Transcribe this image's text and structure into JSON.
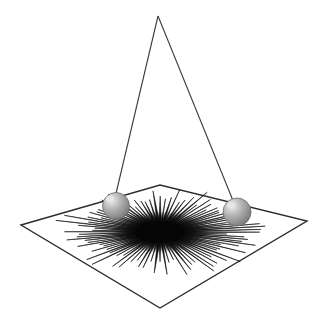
{
  "scene": {
    "title": "Spherical pendulum with radial spike burst on ground plane",
    "width": 329,
    "height": 332,
    "background_color": "#ffffff",
    "line_color": "#2b2b2b",
    "spike_color": "#111111",
    "sphere_light_color": "#e6e6e6",
    "sphere_mid_color": "#a8a8a8",
    "sphere_dark_color": "#7d7d7d",
    "sphere_edge_color": "#6b6b6b"
  },
  "apex": {
    "label": "pivot-apex",
    "x": 158,
    "y": 16
  },
  "strings": [
    {
      "label": "left-string",
      "x1": 158,
      "y1": 16,
      "x2": 114,
      "y2": 202
    },
    {
      "label": "right-string",
      "x1": 158,
      "y1": 16,
      "x2": 236,
      "y2": 208
    }
  ],
  "ground_plane": {
    "label": "ground-plane-quadrilateral",
    "points": "21,225 160,185 307,221 160,308",
    "stroke_width": 1.4,
    "fill": "none",
    "corners": [
      {
        "name": "left-corner",
        "x": 21,
        "y": 225
      },
      {
        "name": "top-corner",
        "x": 160,
        "y": 185
      },
      {
        "name": "right-corner",
        "x": 307,
        "y": 221
      },
      {
        "name": "bottom-corner",
        "x": 160,
        "y": 308
      }
    ]
  },
  "spheres": [
    {
      "label": "left-bob",
      "cx": 116,
      "cy": 206,
      "r": 13.5,
      "highlight_x": 110,
      "highlight_y": 199
    },
    {
      "label": "right-bob",
      "cx": 237,
      "cy": 212,
      "r": 14,
      "highlight_x": 231,
      "highlight_y": 205
    }
  ],
  "starburst": {
    "label": "radial-spike-burst",
    "center_x": 160,
    "center_y": 232,
    "spike_count": 96,
    "radius_x": 104,
    "radius_y": 44,
    "squash": 0.42,
    "core_radius_x": 26,
    "core_radius_y": 11,
    "spike_base_width": 3.0,
    "stroke_color": "#0d0d0d"
  },
  "chart_data": {
    "type": "scatter",
    "xlabel": "",
    "ylabel": "",
    "categories": [
      "apex",
      "left-bob",
      "right-bob",
      "burst-center"
    ],
    "values": [
      16,
      206,
      212,
      232
    ]
  }
}
